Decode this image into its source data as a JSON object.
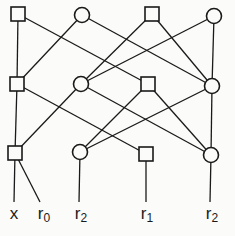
{
  "diagram": {
    "type": "layered-network",
    "nodes": [
      {
        "id": "n1",
        "shape": "square",
        "x": 18,
        "y": 14
      },
      {
        "id": "n2",
        "shape": "circle",
        "x": 82,
        "y": 15
      },
      {
        "id": "n3",
        "shape": "square",
        "x": 152,
        "y": 14
      },
      {
        "id": "n4",
        "shape": "circle",
        "x": 214,
        "y": 16
      },
      {
        "id": "n5",
        "shape": "square",
        "x": 17,
        "y": 84
      },
      {
        "id": "n6",
        "shape": "circle",
        "x": 81,
        "y": 84
      },
      {
        "id": "n7",
        "shape": "square",
        "x": 148,
        "y": 84
      },
      {
        "id": "n8",
        "shape": "circle",
        "x": 212,
        "y": 86
      },
      {
        "id": "n9",
        "shape": "square",
        "x": 15,
        "y": 153
      },
      {
        "id": "n10",
        "shape": "circle",
        "x": 80,
        "y": 152
      },
      {
        "id": "n11",
        "shape": "square",
        "x": 146,
        "y": 154
      },
      {
        "id": "n12",
        "shape": "circle",
        "x": 211,
        "y": 155
      }
    ],
    "edges": [
      [
        "n1",
        "n5"
      ],
      [
        "n1",
        "n7"
      ],
      [
        "n2",
        "n5"
      ],
      [
        "n2",
        "n8"
      ],
      [
        "n3",
        "n6"
      ],
      [
        "n3",
        "n8"
      ],
      [
        "n4",
        "n6"
      ],
      [
        "n4",
        "n8"
      ],
      [
        "n5",
        "n9"
      ],
      [
        "n5",
        "n11"
      ],
      [
        "n6",
        "n9"
      ],
      [
        "n6",
        "n12"
      ],
      [
        "n7",
        "n10"
      ],
      [
        "n7",
        "n12"
      ],
      [
        "n8",
        "n10"
      ],
      [
        "n8",
        "n12"
      ]
    ],
    "leaf_edges": [
      {
        "from": "n9",
        "x2": 14,
        "y2": 202
      },
      {
        "from": "n9",
        "x2": 40,
        "y2": 202
      },
      {
        "from": "n10",
        "x2": 79,
        "y2": 202
      },
      {
        "from": "n11",
        "x2": 146,
        "y2": 202
      },
      {
        "from": "n12",
        "x2": 210,
        "y2": 202
      }
    ],
    "labels": [
      {
        "base": "x",
        "sub": "",
        "x": 14
      },
      {
        "base": "r",
        "sub": "0",
        "x": 44
      },
      {
        "base": "r",
        "sub": "2",
        "x": 81
      },
      {
        "base": "r",
        "sub": "1",
        "x": 147
      },
      {
        "base": "r",
        "sub": "2",
        "x": 212
      }
    ]
  }
}
